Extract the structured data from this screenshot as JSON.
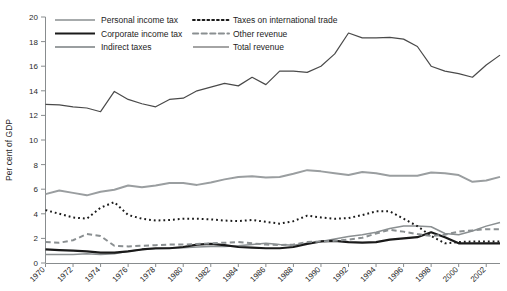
{
  "chart_data": {
    "type": "line",
    "title": "",
    "xlabel": "",
    "ylabel": "Per cent of GDP",
    "ylim": [
      0,
      20
    ],
    "ytick_step": 2,
    "xlim": [
      1970,
      2003
    ],
    "grid": false,
    "legend_position": "top-left",
    "yticks": [
      "0",
      "2",
      "4",
      "6",
      "8",
      "10",
      "12",
      "14",
      "16",
      "18",
      "20"
    ],
    "x": [
      1970,
      1971,
      1972,
      1973,
      1974,
      1975,
      1976,
      1977,
      1978,
      1979,
      1980,
      1981,
      1982,
      1983,
      1984,
      1985,
      1986,
      1987,
      1988,
      1989,
      1990,
      1991,
      1992,
      1993,
      1994,
      1995,
      1996,
      1997,
      1998,
      1999,
      2000,
      2001,
      2002,
      2003
    ],
    "xticks": [
      "1970",
      "1972",
      "1974",
      "1976",
      "1978",
      "1980",
      "1982",
      "1984",
      "1986",
      "1988",
      "1990",
      "1992",
      "1994",
      "1996",
      "1998",
      "2000",
      "2002"
    ],
    "series": [
      {
        "name": "Personal income tax",
        "style": "solid",
        "color": "#8a8f91",
        "width": 1.5,
        "values": [
          0.7,
          0.7,
          0.7,
          0.75,
          0.7,
          0.75,
          0.95,
          1.1,
          1.15,
          1.2,
          1.25,
          1.3,
          1.35,
          1.35,
          1.4,
          1.5,
          1.6,
          1.5,
          1.45,
          1.6,
          1.75,
          1.95,
          2.15,
          2.3,
          2.5,
          2.8,
          3.0,
          3.0,
          2.95,
          2.4,
          2.3,
          2.6,
          3.0,
          3.3
        ]
      },
      {
        "name": "Corporate income tax",
        "style": "solid",
        "color": "#1a1a1a",
        "width": 2.2,
        "values": [
          1.1,
          1.05,
          1.0,
          0.95,
          0.85,
          0.85,
          0.95,
          1.1,
          1.2,
          1.2,
          1.3,
          1.5,
          1.55,
          1.45,
          1.3,
          1.25,
          1.2,
          1.2,
          1.3,
          1.55,
          1.75,
          1.8,
          1.7,
          1.65,
          1.7,
          1.9,
          2.0,
          2.1,
          2.5,
          2.1,
          1.6,
          1.6,
          1.6,
          1.6
        ]
      },
      {
        "name": "Indirect taxes",
        "style": "solid",
        "color": "#9a9ea0",
        "width": 2.0,
        "values": [
          5.6,
          5.9,
          5.7,
          5.5,
          5.8,
          5.95,
          6.3,
          6.15,
          6.3,
          6.5,
          6.5,
          6.35,
          6.55,
          6.8,
          7.0,
          7.05,
          6.95,
          7.0,
          7.25,
          7.55,
          7.45,
          7.3,
          7.15,
          7.4,
          7.3,
          7.1,
          7.1,
          7.1,
          7.35,
          7.3,
          7.15,
          6.6,
          6.7,
          7.0
        ]
      },
      {
        "name": "Taxes on international trade",
        "style": "dotted",
        "color": "#1a1a1a",
        "width": 2.0,
        "values": [
          4.3,
          4.0,
          3.7,
          3.6,
          4.5,
          4.95,
          3.9,
          3.6,
          3.45,
          3.5,
          3.6,
          3.6,
          3.55,
          3.45,
          3.4,
          3.5,
          3.35,
          3.2,
          3.4,
          3.85,
          3.7,
          3.6,
          3.65,
          3.9,
          4.2,
          4.2,
          3.6,
          3.0,
          2.2,
          1.6,
          1.7,
          1.75,
          1.75,
          1.75
        ]
      },
      {
        "name": "Other revenue",
        "style": "dashed",
        "color": "#8a8f91",
        "width": 2.0,
        "values": [
          1.7,
          1.65,
          1.85,
          2.35,
          2.2,
          1.4,
          1.35,
          1.4,
          1.45,
          1.5,
          1.5,
          1.55,
          1.6,
          1.65,
          1.7,
          1.6,
          1.5,
          1.45,
          1.5,
          1.7,
          1.75,
          1.8,
          1.9,
          2.05,
          2.4,
          2.7,
          2.55,
          2.35,
          2.2,
          2.3,
          2.55,
          2.65,
          2.75,
          2.75
        ]
      },
      {
        "name": "Total revenue",
        "style": "solid",
        "color": "#4a4a4a",
        "width": 1.2,
        "values": [
          12.9,
          12.85,
          12.7,
          12.6,
          12.3,
          13.95,
          13.3,
          12.95,
          12.7,
          13.3,
          13.4,
          14.0,
          14.3,
          14.6,
          14.4,
          15.1,
          14.5,
          15.6,
          15.6,
          15.5,
          16.0,
          17.0,
          18.7,
          18.3,
          18.3,
          18.35,
          18.2,
          17.6,
          16.0,
          15.6,
          15.4,
          15.1,
          16.1,
          16.9
        ]
      }
    ]
  },
  "legend": {
    "items": [
      {
        "label": "Personal income tax"
      },
      {
        "label": "Corporate income tax"
      },
      {
        "label": "Indirect taxes"
      },
      {
        "label": "Taxes on international trade"
      },
      {
        "label": "Other revenue"
      },
      {
        "label": "Total revenue"
      }
    ]
  }
}
